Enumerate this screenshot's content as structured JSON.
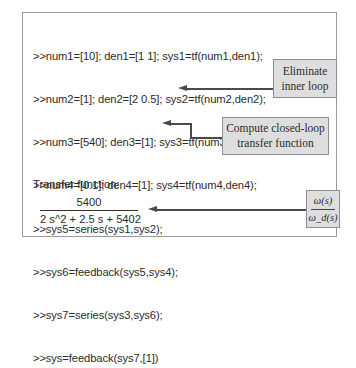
{
  "code_lines": [
    ">>num1=[10]; den1=[1 1]; sys1=tf(num1,den1);",
    ">>num2=[1]; den2=[2 0.5]; sys2=tf(num2,den2);",
    ">>num3=[540]; den3=[1]; sys3=tf(num3,den3);",
    ">>num4=[0.1]; den4=[1]; sys4=tf(num4,den4);",
    ">>sys5=series(sys1,sys2);",
    ">>sys6=feedback(sys5,sys4);",
    ">>sys7=series(sys3,sys6);",
    ">>sys=feedback(sys7,[1])"
  ],
  "callouts": {
    "eliminate": {
      "line1": "Eliminate",
      "line2": "inner loop"
    },
    "closed_loop": {
      "line1": "Compute closed-loop",
      "line2": "transfer function"
    },
    "output_ratio": {
      "numerator": "ω(s)",
      "denominator": "ω_d(s)"
    }
  },
  "result": {
    "label": "Transfer function:",
    "numerator": "5400",
    "denominator": "2 s^2 + 2.5 s + 5402"
  }
}
